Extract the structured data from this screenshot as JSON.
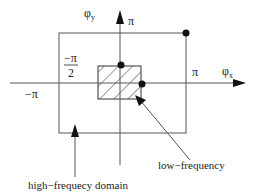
{
  "diagram": {
    "type": "frequency-domain-partition",
    "axes": {
      "x_label": "φ",
      "x_subscript": "x",
      "y_label": "φ",
      "y_subscript": "y"
    },
    "ticks": {
      "x_pos": "π",
      "x_neg": "−π",
      "y_pos": "π",
      "neg_half_num": "−π",
      "neg_half_den": "2"
    },
    "regions": {
      "low": {
        "label": "low−frequency",
        "pattern": "diagonal-hatch"
      },
      "high": {
        "label": "high−frequecy domain"
      }
    },
    "colors": {
      "line": "#555555",
      "arrow": "#111111",
      "dot": "#111111",
      "text": "#222222"
    }
  }
}
